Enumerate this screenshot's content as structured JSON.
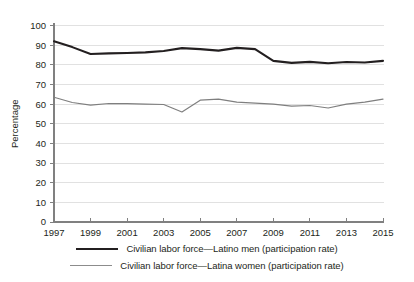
{
  "chart_data": {
    "type": "line",
    "title": "",
    "xlabel": "",
    "ylabel": "Percentage",
    "xlim": [
      1997,
      2015
    ],
    "ylim": [
      0,
      100
    ],
    "grid": true,
    "legend_position": "bottom",
    "x": [
      1997,
      1998,
      1999,
      2000,
      2001,
      2002,
      2003,
      2004,
      2005,
      2006,
      2007,
      2008,
      2009,
      2010,
      2011,
      2012,
      2013,
      2014,
      2015
    ],
    "xticks": [
      "1997",
      "1999",
      "2001",
      "2003",
      "2005",
      "2007",
      "2009",
      "2011",
      "2013",
      "2015"
    ],
    "yticks": [
      "0",
      "10",
      "20",
      "30",
      "40",
      "50",
      "60",
      "70",
      "80",
      "90",
      "100"
    ],
    "series": [
      {
        "name": "Civilian labor force—Latino men (participation rate)",
        "color": "#231f20",
        "width": 2.1,
        "values": [
          92.0,
          89.0,
          85.5,
          85.8,
          86.0,
          86.3,
          87.0,
          88.5,
          88.0,
          87.2,
          88.6,
          88.0,
          82.0,
          81.0,
          81.5,
          80.8,
          81.4,
          81.2,
          82.0
        ]
      },
      {
        "name": "Civilian labor force—Latina women (participation rate)",
        "color": "#7f7f7f",
        "width": 1.2,
        "values": [
          63.5,
          60.8,
          59.5,
          60.3,
          60.2,
          60.0,
          59.8,
          56.0,
          62.0,
          62.5,
          61.0,
          60.5,
          60.0,
          59.0,
          59.3,
          58.0,
          60.0,
          61.0,
          62.5
        ]
      }
    ]
  },
  "legend": [
    {
      "label": "Civilian labor force—Latino men (participation rate)",
      "color": "#231f20",
      "thickness": "2.2px"
    },
    {
      "label": "Civilian labor force—Latina women (participation rate)",
      "color": "#8c8c8c",
      "thickness": "1.2px"
    }
  ]
}
